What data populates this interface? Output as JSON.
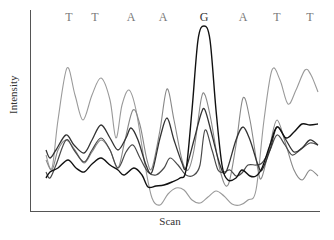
{
  "chart_data": {
    "type": "line",
    "title": "",
    "xlabel": "Scan",
    "ylabel": "Intensity",
    "grid": false,
    "legend": "none",
    "base_calls": [
      {
        "base": "T",
        "x": 69
      },
      {
        "base": "T",
        "x": 95
      },
      {
        "base": "A",
        "x": 131
      },
      {
        "base": "A",
        "x": 163
      },
      {
        "base": "G",
        "x": 204
      },
      {
        "base": "A",
        "x": 243
      },
      {
        "base": "T",
        "x": 277
      },
      {
        "base": "T",
        "x": 310
      }
    ],
    "plot_area": {
      "x0": 30,
      "y0": 10,
      "x1": 320,
      "y1": 211
    },
    "series": [
      {
        "name": "T channel",
        "color": "#9a9a9a",
        "width": 1.1,
        "points": [
          [
            46,
            155
          ],
          [
            52,
            168
          ],
          [
            58,
            120
          ],
          [
            67,
            68
          ],
          [
            75,
            95
          ],
          [
            83,
            120
          ],
          [
            92,
            95
          ],
          [
            101,
            78
          ],
          [
            110,
            100
          ],
          [
            116,
            138
          ],
          [
            122,
            105
          ],
          [
            129,
            90
          ],
          [
            136,
            110
          ],
          [
            145,
            165
          ],
          [
            152,
            198
          ],
          [
            160,
            205
          ],
          [
            168,
            194
          ],
          [
            176,
            188
          ],
          [
            184,
            190
          ],
          [
            192,
            200
          ],
          [
            200,
            203
          ],
          [
            208,
            197
          ],
          [
            216,
            191
          ],
          [
            224,
            196
          ],
          [
            232,
            204
          ],
          [
            240,
            205
          ],
          [
            248,
            200
          ],
          [
            256,
            190
          ],
          [
            264,
            120
          ],
          [
            272,
            70
          ],
          [
            280,
            80
          ],
          [
            288,
            104
          ],
          [
            296,
            90
          ],
          [
            305,
            70
          ],
          [
            311,
            75
          ],
          [
            318,
            92
          ]
        ]
      },
      {
        "name": "A channel",
        "color": "#888888",
        "width": 1.1,
        "points": [
          [
            46,
            160
          ],
          [
            52,
            170
          ],
          [
            58,
            150
          ],
          [
            66,
            140
          ],
          [
            75,
            150
          ],
          [
            84,
            163
          ],
          [
            92,
            152
          ],
          [
            101,
            140
          ],
          [
            110,
            150
          ],
          [
            118,
            168
          ],
          [
            125,
            140
          ],
          [
            133,
            110
          ],
          [
            140,
            125
          ],
          [
            147,
            160
          ],
          [
            152,
            168
          ],
          [
            160,
            130
          ],
          [
            167,
            89
          ],
          [
            174,
            120
          ],
          [
            182,
            160
          ],
          [
            188,
            170
          ],
          [
            194,
            150
          ],
          [
            201,
            100
          ],
          [
            205,
            95
          ],
          [
            211,
            120
          ],
          [
            220,
            170
          ],
          [
            228,
            185
          ],
          [
            236,
            145
          ],
          [
            243,
            98
          ],
          [
            250,
            120
          ],
          [
            258,
            170
          ],
          [
            262,
            177
          ],
          [
            270,
            145
          ],
          [
            277,
            120
          ],
          [
            286,
            145
          ],
          [
            294,
            170
          ],
          [
            302,
            180
          ],
          [
            310,
            170
          ],
          [
            318,
            176
          ]
        ]
      },
      {
        "name": "C channel",
        "color": "#4a4a4a",
        "width": 1.2,
        "points": [
          [
            46,
            172
          ],
          [
            50,
            178
          ],
          [
            56,
            165
          ],
          [
            66,
            140
          ],
          [
            74,
            150
          ],
          [
            84,
            162
          ],
          [
            92,
            150
          ],
          [
            101,
            138
          ],
          [
            110,
            150
          ],
          [
            118,
            168
          ],
          [
            126,
            152
          ],
          [
            133,
            145
          ],
          [
            140,
            158
          ],
          [
            148,
            172
          ],
          [
            156,
            175
          ],
          [
            164,
            168
          ],
          [
            170,
            158
          ],
          [
            178,
            165
          ],
          [
            186,
            175
          ],
          [
            194,
            175
          ],
          [
            200,
            165
          ],
          [
            205,
            130
          ],
          [
            212,
            150
          ],
          [
            218,
            170
          ],
          [
            224,
            172
          ],
          [
            230,
            170
          ],
          [
            236,
            176
          ],
          [
            242,
            173
          ],
          [
            248,
            165
          ],
          [
            256,
            165
          ],
          [
            262,
            163
          ],
          [
            270,
            150
          ],
          [
            277,
            135
          ],
          [
            285,
            145
          ],
          [
            292,
            155
          ],
          [
            300,
            150
          ],
          [
            310,
            143
          ],
          [
            318,
            145
          ]
        ]
      },
      {
        "name": "mid dark channel",
        "color": "#333333",
        "width": 1.3,
        "points": [
          [
            46,
            150
          ],
          [
            50,
            158
          ],
          [
            56,
            150
          ],
          [
            66,
            135
          ],
          [
            74,
            145
          ],
          [
            84,
            153
          ],
          [
            92,
            140
          ],
          [
            101,
            125
          ],
          [
            110,
            138
          ],
          [
            118,
            150
          ],
          [
            126,
            138
          ],
          [
            131,
            128
          ],
          [
            138,
            140
          ],
          [
            146,
            165
          ],
          [
            152,
            172
          ],
          [
            160,
            138
          ],
          [
            167,
            118
          ],
          [
            174,
            140
          ],
          [
            182,
            163
          ],
          [
            186,
            168
          ],
          [
            194,
            140
          ],
          [
            201,
            114
          ],
          [
            205,
            110
          ],
          [
            212,
            135
          ],
          [
            220,
            165
          ],
          [
            226,
            172
          ],
          [
            236,
            140
          ],
          [
            243,
            127
          ],
          [
            250,
            140
          ],
          [
            258,
            165
          ],
          [
            262,
            170
          ],
          [
            270,
            150
          ],
          [
            277,
            127
          ],
          [
            286,
            140
          ],
          [
            294,
            152
          ],
          [
            302,
            148
          ],
          [
            310,
            140
          ],
          [
            318,
            145
          ]
        ]
      },
      {
        "name": "G channel",
        "color": "#111111",
        "width": 1.4,
        "points": [
          [
            46,
            178
          ],
          [
            50,
            172
          ],
          [
            58,
            168
          ],
          [
            68,
            160
          ],
          [
            76,
            168
          ],
          [
            84,
            172
          ],
          [
            92,
            164
          ],
          [
            101,
            158
          ],
          [
            110,
            165
          ],
          [
            118,
            170
          ],
          [
            124,
            175
          ],
          [
            134,
            168
          ],
          [
            142,
            175
          ],
          [
            148,
            187
          ],
          [
            156,
            186
          ],
          [
            164,
            185
          ],
          [
            172,
            182
          ],
          [
            180,
            178
          ],
          [
            186,
            170
          ],
          [
            192,
            110
          ],
          [
            198,
            40
          ],
          [
            204,
            26
          ],
          [
            210,
            40
          ],
          [
            216,
            110
          ],
          [
            222,
            165
          ],
          [
            228,
            180
          ],
          [
            236,
            178
          ],
          [
            242,
            170
          ],
          [
            250,
            176
          ],
          [
            256,
            176
          ],
          [
            262,
            168
          ],
          [
            270,
            145
          ],
          [
            277,
            127
          ],
          [
            286,
            138
          ],
          [
            294,
            132
          ],
          [
            302,
            124
          ],
          [
            310,
            125
          ],
          [
            318,
            124
          ]
        ]
      }
    ]
  }
}
